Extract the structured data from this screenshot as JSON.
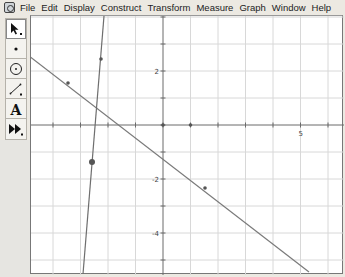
{
  "app": {
    "name": "Geometer's Sketchpad",
    "icon": "sketchpad-app-icon"
  },
  "menubar": {
    "items": [
      "File",
      "Edit",
      "Display",
      "Construct",
      "Transform",
      "Measure",
      "Graph",
      "Window",
      "Help"
    ]
  },
  "toolbox": {
    "tools": [
      {
        "name": "selection-arrow-tool",
        "icon": "arrow-icon",
        "selected": true
      },
      {
        "name": "point-tool",
        "icon": "point-icon",
        "selected": false
      },
      {
        "name": "compass-tool",
        "icon": "compass-circle-icon",
        "selected": false
      },
      {
        "name": "straightedge-tool",
        "icon": "straightedge-icon",
        "selected": false
      },
      {
        "name": "text-tool",
        "icon": "text-a-icon",
        "label": "A",
        "selected": false
      },
      {
        "name": "custom-tools",
        "icon": "custom-tools-icon",
        "selected": false
      }
    ]
  },
  "graph": {
    "origin_px": [
      132,
      109
    ],
    "unit_px_x": 27.5,
    "unit_px_y": 27,
    "x_tick_labels": [
      {
        "value": 5,
        "text": "5"
      }
    ],
    "y_tick_labels": [
      {
        "value": 2,
        "text": "2"
      },
      {
        "value": -2,
        "text": "-2"
      },
      {
        "value": -4,
        "text": "-4"
      }
    ],
    "axis_points": [
      {
        "x": 0,
        "y": 0,
        "label": "origin"
      },
      {
        "x": 1,
        "y": 0,
        "label": "unit-point"
      }
    ],
    "lines": [
      {
        "name": "decreasing-line",
        "from_px": [
          -2,
          40
        ],
        "to_px": [
          278,
          256
        ],
        "color": "#7a7a7a"
      },
      {
        "name": "steep-line",
        "from_px": [
          73,
          0
        ],
        "to_px": [
          52,
          258
        ],
        "color": "#6e6e6e"
      }
    ],
    "points": [
      {
        "name": "point-on-decreasing-line-1",
        "px": [
          37,
          67
        ],
        "r": 1.8
      },
      {
        "name": "point-on-decreasing-line-2",
        "px": [
          174,
          172
        ],
        "r": 1.8
      },
      {
        "name": "point-on-steep-line-1",
        "px": [
          70,
          43
        ],
        "r": 1.8
      },
      {
        "name": "point-on-steep-line-2-selected",
        "px": [
          61,
          146
        ],
        "r": 3
      }
    ],
    "colors": {
      "grid": "#d8d8d8",
      "axis": "#6a6a6a",
      "point": "#555555"
    }
  }
}
